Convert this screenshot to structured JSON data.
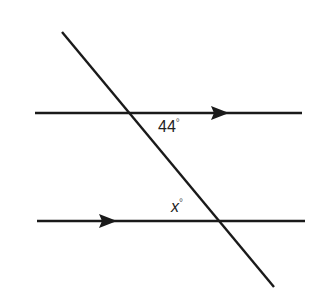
{
  "diagram": {
    "type": "parallel-lines-transversal",
    "stroke_color": "#1a1a1a",
    "lines": {
      "top_parallel": {
        "x1": 35,
        "y1": 113,
        "x2": 302,
        "y2": 113,
        "arrow_at_x": 220
      },
      "bottom_parallel": {
        "x1": 37,
        "y1": 221,
        "x2": 305,
        "y2": 221,
        "arrow_at_x": 108
      },
      "transversal": {
        "x1": 62,
        "y1": 32,
        "x2": 274,
        "y2": 287
      }
    },
    "angles": [
      {
        "id": "known",
        "value": "44",
        "unit": "°"
      },
      {
        "id": "unknown",
        "value": "x",
        "unit": "°"
      }
    ]
  }
}
